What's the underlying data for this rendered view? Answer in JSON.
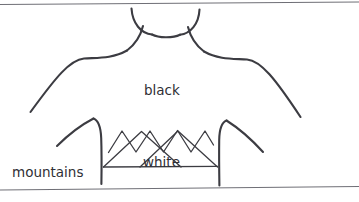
{
  "figure": {
    "kind": "hand-drawn-sketch",
    "background_color": "#ffffff",
    "ink_color": "#3c3c42",
    "frame_color": "#6f6f76"
  },
  "labels": {
    "black": "black",
    "white": "white",
    "mountains": "mountains"
  },
  "annotations": [
    {
      "name": "shirt-body-fill",
      "text": "black"
    },
    {
      "name": "mountain-graphic-fill",
      "text": "white"
    },
    {
      "name": "mountain-graphic",
      "text": "mountains"
    }
  ],
  "graphic": {
    "peak_count": 4,
    "has_baseline": true
  }
}
